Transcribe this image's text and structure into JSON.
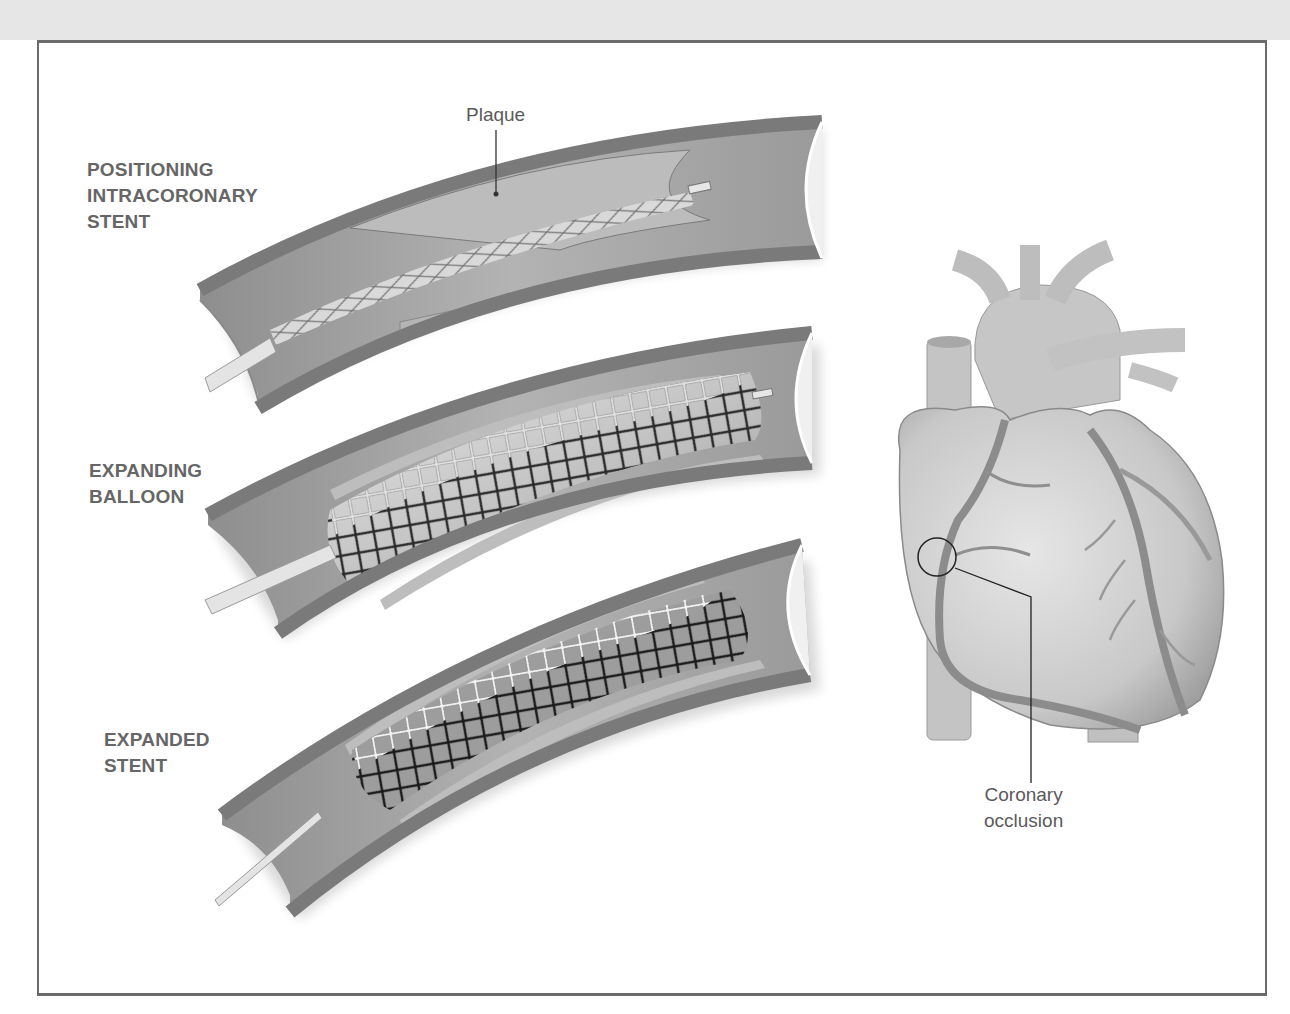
{
  "figure": {
    "stages": [
      {
        "id": "positioning",
        "lines": [
          "POSITIONING",
          "INTRACORONARY",
          "STENT"
        ]
      },
      {
        "id": "expanding",
        "lines": [
          "EXPANDING",
          "BALLOON"
        ]
      },
      {
        "id": "expanded",
        "lines": [
          "EXPANDED",
          "STENT"
        ]
      }
    ],
    "callouts": {
      "plaque": "Plaque",
      "occlusion_line1": "Coronary",
      "occlusion_line2": "occlusion"
    },
    "icons": {
      "vessel": "artery-cross-section-illustration",
      "heart": "heart-anterior-view-illustration",
      "occlusion_marker": "circle-marker"
    },
    "colors": {
      "vessel_wall": "#7a7a7a",
      "vessel_lumen": "#a9a9a9",
      "plaque": "#bdbdbd",
      "stent_dark": "#1a1a1a",
      "stent_light": "#f2f2f2",
      "heart_fill": "#cfcfcf",
      "label_text": "#666666",
      "frame_border": "#6b6b6b",
      "top_band": "#e6e6e6"
    }
  }
}
